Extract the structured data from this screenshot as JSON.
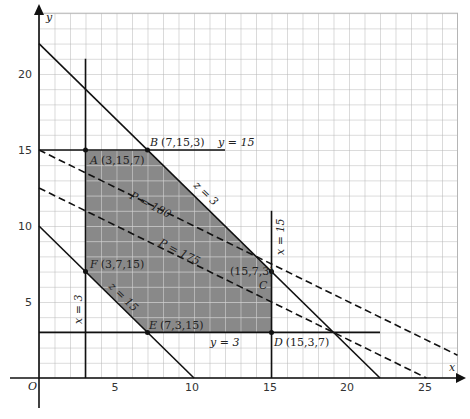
{
  "axes": {
    "x_label": "x",
    "y_label": "y",
    "origin_label": "O",
    "x_ticks": [
      "5",
      "10",
      "15",
      "20",
      "25"
    ],
    "y_ticks": [
      "5",
      "10",
      "15",
      "20"
    ],
    "x_range": [
      0,
      27
    ],
    "y_range": [
      0,
      24
    ]
  },
  "colors": {
    "feasible_fill": "#898989",
    "grid": "#b5b5b5",
    "inner_grid": "#cfcfcf",
    "line": "#111111"
  },
  "constraint_labels": {
    "y15": "y = 15",
    "z3": "z = 3",
    "x15": "x = 15",
    "x3": "x = 3",
    "z15": "z = 15",
    "y3": "y = 3"
  },
  "objective_labels": {
    "p180": "P = 180",
    "p175": "P = 175"
  },
  "vertices": [
    {
      "name": "A",
      "coords": "(3,15,7)",
      "x": 3,
      "y": 15
    },
    {
      "name": "B",
      "coords": "(7,15,3)",
      "x": 7,
      "y": 15
    },
    {
      "name": "C",
      "coords": "(15,7,3)",
      "x": 15,
      "y": 7
    },
    {
      "name": "D",
      "coords": "(15,3,7)",
      "x": 15,
      "y": 3
    },
    {
      "name": "E",
      "coords": "(7,3,15)",
      "x": 7,
      "y": 3
    },
    {
      "name": "F",
      "coords": "(3,7,15)",
      "x": 3,
      "y": 7
    }
  ],
  "lines": [
    {
      "name": "z = 3",
      "equation": "x + y = 22",
      "style": "solid"
    },
    {
      "name": "z = 15",
      "equation": "x + y = 10",
      "style": "solid"
    },
    {
      "name": "x = 3",
      "equation": "x = 3",
      "style": "solid"
    },
    {
      "name": "x = 15",
      "equation": "x = 15",
      "style": "solid"
    },
    {
      "name": "y = 15",
      "equation": "y = 15",
      "style": "solid"
    },
    {
      "name": "y = 3",
      "equation": "y = 3",
      "style": "solid"
    },
    {
      "name": "P = 180",
      "equation": "x + 2y = 30",
      "style": "dashed"
    },
    {
      "name": "P = 175",
      "equation": "x + 2y = 25",
      "style": "dashed"
    }
  ]
}
